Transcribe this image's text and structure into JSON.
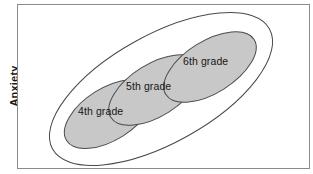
{
  "figure": {
    "type": "euler-diagram",
    "axis": {
      "y_label": "Anxiety"
    },
    "frame": {
      "border_color": "#8b8b8b",
      "background": "#ffffff"
    },
    "outer_set": {
      "name": "overall-anxiety-envelope",
      "fill": "none",
      "stroke": "#4a4a4a",
      "label": ""
    },
    "groups": [
      {
        "id": "grade-4",
        "label": "4th grade",
        "fill": "#c8c8c8",
        "stroke": "#4a4a4a",
        "position": "lower-left"
      },
      {
        "id": "grade-5",
        "label": "5th grade",
        "fill": "#c8c8c8",
        "stroke": "#4a4a4a",
        "position": "center"
      },
      {
        "id": "grade-6",
        "label": "6th grade",
        "fill": "#c8c8c8",
        "stroke": "#4a4a4a",
        "position": "upper-right"
      }
    ]
  }
}
